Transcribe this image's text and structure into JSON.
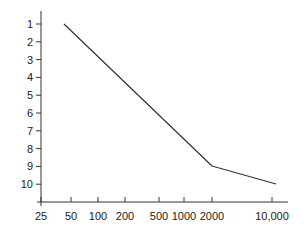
{
  "chart_data": {
    "type": "line",
    "title": "",
    "xlabel": "",
    "ylabel": "",
    "x_scale": "log",
    "y_inverted": true,
    "x_ticks": [
      {
        "value": 25,
        "label": "25",
        "px": 41
      },
      {
        "value": 50,
        "label": "50",
        "px": 71
      },
      {
        "value": 100,
        "label": "100",
        "px": 98
      },
      {
        "value": 200,
        "label": "200",
        "px": 125
      },
      {
        "value": 500,
        "label": "500",
        "px": 159
      },
      {
        "value": 1000,
        "label": "1000",
        "px": 184
      },
      {
        "value": 2000,
        "label": "2000",
        "px": 212
      },
      {
        "value": 10000,
        "label": "10,000",
        "px": 272
      }
    ],
    "y_ticks": [
      {
        "value": 1,
        "label": "1"
      },
      {
        "value": 2,
        "label": "2"
      },
      {
        "value": 3,
        "label": "3"
      },
      {
        "value": 4,
        "label": "4"
      },
      {
        "value": 5,
        "label": "5"
      },
      {
        "value": 6,
        "label": "6"
      },
      {
        "value": 7,
        "label": "7"
      },
      {
        "value": 8,
        "label": "8"
      },
      {
        "value": 9,
        "label": "9"
      },
      {
        "value": 10,
        "label": "10"
      }
    ],
    "ylim": [
      1,
      10
    ],
    "xlim": [
      25,
      10000
    ],
    "grid": false,
    "legend": null,
    "series": [
      {
        "name": "line",
        "color": "#333333",
        "points": [
          {
            "x": 40,
            "y": 1,
            "px": 64,
            "py": 24
          },
          {
            "x": 2000,
            "y": 9,
            "px": 212,
            "py": 166
          },
          {
            "x": 11000,
            "y": 10,
            "px": 276,
            "py": 184
          }
        ]
      }
    ]
  },
  "axis": {
    "color": "#333333",
    "y_axis_x": 41,
    "y_axis_top": 11,
    "x_axis_y": 202,
    "x_axis_right": 288,
    "y_tick_first": 24,
    "y_tick_step": 17.8
  }
}
